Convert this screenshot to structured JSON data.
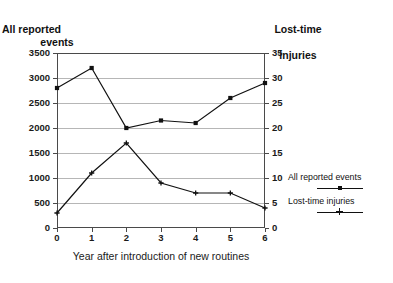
{
  "chart_data": {
    "type": "line",
    "title": "",
    "x": [
      0,
      1,
      2,
      3,
      4,
      5,
      6
    ],
    "categories": [
      "0",
      "1",
      "2",
      "3",
      "4",
      "5",
      "6"
    ],
    "xlabel": "Year after introduction of new routines",
    "xlim": [
      0,
      6
    ],
    "grid": true,
    "legend_position": "right",
    "series": [
      {
        "name": "All reported events",
        "axis": "left",
        "marker": "square",
        "values": [
          2800,
          3200,
          2000,
          2150,
          2100,
          2600,
          2900
        ]
      },
      {
        "name": "Lost-time injuries",
        "axis": "right",
        "marker": "cross",
        "values": [
          3,
          11,
          17,
          9,
          7,
          7,
          4
        ]
      }
    ],
    "left_axis": {
      "title_line1": "All reported",
      "title_line2": "events",
      "label": "All reported events",
      "ylim": [
        0,
        3500
      ],
      "tick_step": 500,
      "ticks": [
        "3500",
        "3000",
        "2500",
        "2000",
        "1500",
        "1000",
        "500",
        "0"
      ],
      "tick_values": [
        3500,
        3000,
        2500,
        2000,
        1500,
        1000,
        500,
        0
      ]
    },
    "right_axis": {
      "title_line1": "Lost-time",
      "title_line2": "injuries",
      "label": "Lost-time injuries",
      "ylim": [
        0,
        35
      ],
      "tick_step": 5,
      "ticks": [
        "35",
        "30",
        "25",
        "20",
        "15",
        "10",
        "5",
        "0"
      ],
      "tick_values": [
        35,
        30,
        25,
        20,
        15,
        10,
        5,
        0
      ]
    },
    "colors": {
      "series_line": "#111111",
      "gridline": "#b6b6b6",
      "frame": "#4a4a4a",
      "background": "#ffffff",
      "text": "#1a1a1a"
    }
  },
  "legend": {
    "entries": [
      {
        "label": "All reported events",
        "marker": "square"
      },
      {
        "label": "Lost-time injuries",
        "marker": "cross"
      }
    ]
  }
}
